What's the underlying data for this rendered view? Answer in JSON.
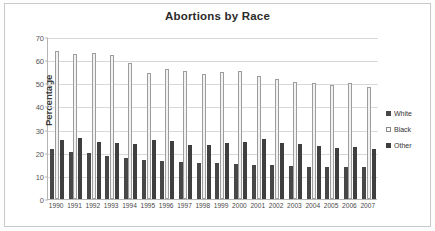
{
  "chart_data": {
    "type": "bar",
    "title": "Abortions by Race",
    "xlabel": "",
    "ylabel": "Percentage",
    "ylim": [
      0,
      70
    ],
    "ytick_step": 10,
    "yticks": [
      0,
      10,
      20,
      30,
      40,
      50,
      60,
      70
    ],
    "grid": true,
    "legend_position": "right",
    "categories": [
      "1990",
      "1991",
      "1992",
      "1993",
      "1994",
      "1995",
      "1996",
      "1997",
      "1998",
      "1999",
      "2000",
      "2001",
      "2002",
      "2003",
      "2004",
      "2005",
      "2006",
      "2007"
    ],
    "series": [
      {
        "name": "White",
        "color": "#474747",
        "values": [
          21.5,
          20.2,
          19.7,
          18.8,
          17.7,
          16.9,
          16.4,
          16.0,
          15.6,
          15.4,
          15.2,
          14.8,
          14.5,
          14.3,
          13.9,
          13.7,
          13.9,
          13.7
        ]
      },
      {
        "name": "Black",
        "color": "#f2f2f2",
        "values": [
          63.9,
          62.8,
          63.2,
          62.3,
          58.9,
          54.5,
          56.3,
          55.3,
          54.1,
          55.0,
          55.1,
          53.1,
          52.0,
          50.7,
          50.0,
          49.3,
          50.2,
          48.2
        ]
      },
      {
        "name": "Other",
        "color": "#3f3f3f",
        "values": [
          25.3,
          26.3,
          24.6,
          24.0,
          23.9,
          25.5,
          24.9,
          23.4,
          23.4,
          24.3,
          24.6,
          26.0,
          24.0,
          23.9,
          23.1,
          22.0,
          22.5,
          21.8
        ]
      }
    ]
  },
  "legend": {
    "items": [
      {
        "label": "White",
        "swatch": "swatch-white"
      },
      {
        "label": "Black",
        "swatch": "swatch-black"
      },
      {
        "label": "Other",
        "swatch": "swatch-other"
      }
    ]
  }
}
